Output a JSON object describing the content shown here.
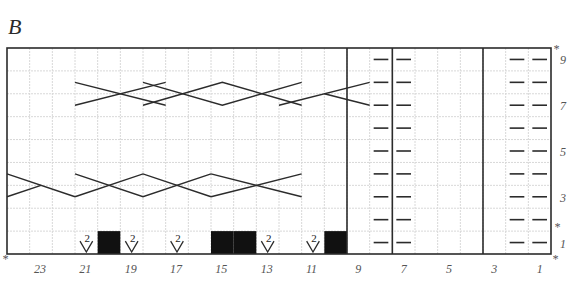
{
  "title": "B",
  "grid": {
    "columns": 24,
    "rows": 9,
    "left": 7,
    "right": 551,
    "top": 48,
    "bottom": 254,
    "grid_color": "#d8d8d8",
    "line_color": "#2b2b2b"
  },
  "column_labels": [
    "23",
    "21",
    "19",
    "17",
    "15",
    "13",
    "11",
    "9",
    "7",
    "5",
    "3",
    "1"
  ],
  "row_labels": [
    "1",
    "3",
    "5",
    "7",
    "9"
  ],
  "repeat_markers": {
    "symbol": "*",
    "row_markers": [
      "top-right above row 9",
      "right between rows 1 and 2"
    ],
    "column_markers": [
      "bottom-left before column 24",
      "bottom-right after column 1"
    ]
  },
  "thick_dividers_after_column": [
    9,
    7,
    3
  ],
  "purl_columns": [
    8,
    7,
    2,
    1
  ],
  "purl_symbol": "—",
  "row1": {
    "black_squares": [
      20,
      15,
      14,
      10
    ],
    "slip_2_symbols": [
      21,
      19,
      17,
      13,
      11
    ],
    "slip_label": "2"
  },
  "cables": [
    {
      "row": "3-4",
      "cols": [
        24,
        22
      ],
      "type": "cross-left-partial"
    },
    {
      "row": "3-4",
      "cols": [
        21,
        16
      ],
      "type": "diamond"
    },
    {
      "row": "3-4",
      "cols": [
        15,
        12
      ],
      "type": "cross"
    },
    {
      "row": "7-8",
      "cols": [
        21,
        18
      ],
      "type": "cross"
    },
    {
      "row": "7-8",
      "cols": [
        18,
        12
      ],
      "type": "diamond"
    },
    {
      "row": "7-8",
      "cols": [
        12,
        9
      ],
      "type": "cross-right-partial"
    }
  ]
}
